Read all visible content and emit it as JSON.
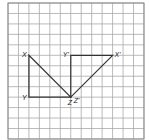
{
  "grid": {
    "cols": 13,
    "rows": 13,
    "origin_x": 8,
    "origin_y": 3,
    "cell": 10.46,
    "line_color": "#a8a8a8"
  },
  "points": {
    "X": {
      "label": "X",
      "col": 2,
      "row": 5
    },
    "Y": {
      "label": "Y",
      "col": 2,
      "row": 9
    },
    "Z": {
      "label": "Z",
      "col": 6,
      "row": 9
    },
    "Xp": {
      "label": "X'",
      "col": 10,
      "row": 5
    },
    "Yp": {
      "label": "Y'",
      "col": 6,
      "row": 5
    },
    "Zp": {
      "label": "Z'",
      "col": 6,
      "row": 9
    }
  },
  "triangles": [
    {
      "name": "XYZ",
      "vertices": [
        "X",
        "Y",
        "Z"
      ]
    },
    {
      "name": "X'Y'Z'",
      "vertices": [
        "Xp",
        "Yp",
        "Zp"
      ]
    }
  ],
  "labels": {
    "X": {
      "text": "X",
      "dx": -7,
      "dy": 2
    },
    "Y": {
      "text": "Y",
      "dx": -7,
      "dy": 3
    },
    "Z": {
      "text": "Z",
      "dx": -3,
      "dy": 8
    },
    "Zp": {
      "text": "Z'",
      "dx": 3,
      "dy": 6
    },
    "Yp": {
      "text": "Y'",
      "dx": -8,
      "dy": 2
    },
    "Xp": {
      "text": "X'",
      "dx": 2,
      "dy": 2
    }
  }
}
